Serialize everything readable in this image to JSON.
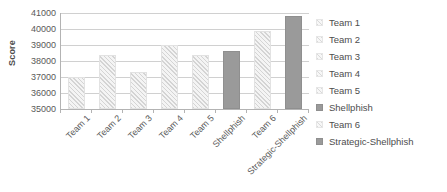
{
  "chart_data": {
    "type": "bar",
    "title": "",
    "subtitle": "",
    "xlabel": "",
    "ylabel": "Score",
    "ylim": [
      35000,
      41000
    ],
    "y_ticks": [
      41000,
      40000,
      39000,
      38000,
      37000,
      36000,
      35000
    ],
    "y_tick_labels": [
      "41000",
      "40000",
      "39000",
      "38000",
      "37000",
      "36000",
      "35000"
    ],
    "grid": true,
    "legend_position": "right",
    "categories": [
      "Team 1",
      "Team 2",
      "Team 3",
      "Team 4",
      "Team 5",
      "Shellphish",
      "Team 6",
      "Strategic-Shellphish"
    ],
    "values": [
      37000,
      38400,
      37300,
      39000,
      38350,
      38600,
      39850,
      40800
    ],
    "bar_styles": [
      "hatched",
      "hatched",
      "hatched",
      "hatched",
      "hatched",
      "solid",
      "hatched",
      "solid"
    ],
    "legend": [
      {
        "label": "Team 1",
        "style": "hatched"
      },
      {
        "label": "Team 2",
        "style": "hatched"
      },
      {
        "label": "Team 3",
        "style": "hatched"
      },
      {
        "label": "Team 4",
        "style": "hatched"
      },
      {
        "label": "Team 5",
        "style": "hatched"
      },
      {
        "label": "Shellphish",
        "style": "solid"
      },
      {
        "label": "Team 6",
        "style": "hatched"
      },
      {
        "label": "Strategic-Shellphish",
        "style": "solid"
      }
    ],
    "colors": {
      "solid_bar": "#9a9a9a",
      "hatched_bar": "#eeeeee",
      "gridline": "#d0d0d0",
      "axis": "#b3b3b3",
      "text": "#595959"
    }
  }
}
